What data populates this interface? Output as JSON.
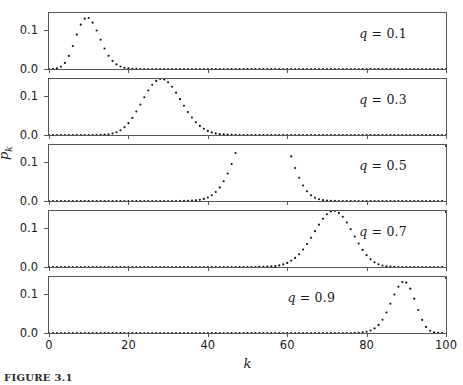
{
  "figure": {
    "caption": "FIGURE 3.1",
    "axes": {
      "xlabel": "k",
      "ylabel_base": "p",
      "ylabel_sub": "k",
      "xticks": [
        0,
        20,
        40,
        60,
        80,
        100
      ],
      "xtick_labels": [
        "0",
        "20",
        "40",
        "60",
        "80",
        "100"
      ],
      "yticks": [
        0.0,
        0.1
      ],
      "ytick_labels": [
        "0.0",
        "0.1"
      ],
      "xlim": [
        0,
        100
      ],
      "ylim": [
        0.0,
        0.145
      ]
    },
    "style": {
      "marker_color": "#111111",
      "axis_color": "#555555",
      "background": "#ffffff",
      "marker_size": 2.1
    }
  },
  "chart_data": {
    "type": "scatter",
    "title": "",
    "xlabel": "k",
    "ylabel": "p̄_k",
    "xlim": [
      0,
      100
    ],
    "ylim": [
      0.0,
      0.145
    ],
    "grid": false,
    "legend": "none",
    "n": 100,
    "panel_annotation_prefix": "q = ",
    "panels": [
      {
        "label": "q = 0.1",
        "q": 0.1,
        "peak_k": 10,
        "peak_value": 0.132,
        "label_pos_frac": 0.78,
        "x": [
          0,
          1,
          2,
          3,
          4,
          5,
          6,
          7,
          8,
          9,
          10,
          11,
          12,
          13,
          14,
          15,
          16,
          17,
          18,
          19,
          20,
          21,
          22,
          23,
          24,
          25,
          26,
          27,
          28,
          29,
          30,
          31,
          32,
          33,
          34,
          35,
          36,
          37,
          38,
          39,
          40,
          41,
          42,
          43,
          44,
          45,
          46,
          47,
          48,
          49,
          50,
          51,
          52,
          53,
          54,
          55,
          56,
          57,
          58,
          59,
          60,
          61,
          62,
          63,
          64,
          65,
          66,
          67,
          68,
          69,
          70,
          71,
          72,
          73,
          74,
          75,
          76,
          77,
          78,
          79,
          80,
          81,
          82,
          83,
          84,
          85,
          86,
          87,
          88,
          89,
          90,
          91,
          92,
          93,
          94,
          95,
          96,
          97,
          98,
          99,
          100
        ],
        "y": [
          3e-05,
          0.0003,
          0.00162,
          0.00589,
          0.01587,
          0.03387,
          0.05957,
          0.08889,
          0.11484,
          0.13041,
          0.13187,
          0.12017,
          0.09963,
          0.07567,
          0.05304,
          0.03449,
          0.02093,
          0.01189,
          0.00634,
          0.00319,
          0.00151,
          0.00068,
          0.00029,
          0.00012,
          5e-05,
          2e-05,
          1e-05,
          0.0,
          0.0,
          0.0,
          0.0,
          0.0,
          0.0,
          0.0,
          0.0,
          0.0,
          0.0,
          0.0,
          0.0,
          0.0,
          0.0,
          0.0,
          0.0,
          0.0,
          0.0,
          0.0,
          0.0,
          0.0,
          0.0,
          0.0,
          0.0,
          0.0,
          0.0,
          0.0,
          0.0,
          0.0,
          0.0,
          0.0,
          0.0,
          0.0,
          0.0,
          0.0,
          0.0,
          0.0,
          0.0,
          0.0,
          0.0,
          0.0,
          0.0,
          0.0,
          0.0,
          0.0,
          0.0,
          0.0,
          0.0,
          0.0,
          0.0,
          0.0,
          0.0,
          0.0,
          0.0,
          0.0,
          0.0,
          0.0,
          0.0,
          0.0,
          0.0,
          0.0,
          0.0,
          0.0,
          0.0,
          0.0,
          0.0,
          0.0,
          0.0,
          0.0,
          0.0,
          0.0,
          0.0,
          0.0,
          0.0,
          0.0,
          0.0
        ]
      },
      {
        "label": "q = 0.3",
        "q": 0.3,
        "peak_k": 30,
        "peak_value": 0.0868,
        "label_pos_frac": 0.78,
        "x": [
          0,
          1,
          2,
          3,
          4,
          5,
          6,
          7,
          8,
          9,
          10,
          11,
          12,
          13,
          14,
          15,
          16,
          17,
          18,
          19,
          20,
          21,
          22,
          23,
          24,
          25,
          26,
          27,
          28,
          29,
          30,
          31,
          32,
          33,
          34,
          35,
          36,
          37,
          38,
          39,
          40,
          41,
          42,
          43,
          44,
          45,
          46,
          47,
          48,
          49,
          50,
          51,
          52,
          53,
          54,
          55,
          56,
          57,
          58,
          59,
          60,
          61,
          62,
          63,
          64,
          65,
          66,
          67,
          68,
          69,
          70,
          71,
          72,
          73,
          74,
          75,
          76,
          77,
          78,
          79,
          80,
          81,
          82,
          83,
          84,
          85,
          86,
          87,
          88,
          89,
          90,
          91,
          92,
          93,
          94,
          95,
          96,
          97,
          98,
          99,
          100
        ],
        "y": [
          0.0,
          0.0,
          0.0,
          0.0,
          0.0,
          0.0,
          0.0,
          0.0,
          0.0,
          0.0,
          2e-05,
          6e-05,
          0.00016,
          0.00039,
          0.0009,
          0.00193,
          0.00383,
          0.00709,
          0.01229,
          0.02,
          0.03065,
          0.04437,
          0.0608,
          0.07906,
          0.09782,
          0.11541,
          0.13006,
          0.14026,
          0.14494,
          0.14365,
          0.13662,
          0.12482,
          0.10967,
          0.09277,
          0.07564,
          0.05949,
          0.04517,
          0.03316,
          0.02354,
          0.01616,
          0.01074,
          0.00691,
          0.00431,
          0.0026,
          0.00152,
          0.00086,
          0.00047,
          0.00025,
          0.00013,
          7e-05,
          3e-05,
          1e-05,
          1e-05,
          0.0,
          0.0,
          0.0,
          0.0,
          0.0,
          0.0,
          0.0,
          0.0,
          0.0,
          0.0,
          0.0,
          0.0,
          0.0,
          0.0,
          0.0,
          0.0,
          0.0,
          0.0,
          0.0,
          0.0,
          0.0,
          0.0,
          0.0,
          0.0,
          0.0,
          0.0,
          0.0,
          0.0,
          0.0,
          0.0,
          0.0,
          0.0,
          0.0,
          0.0,
          0.0,
          0.0,
          0.0,
          0.0,
          0.0,
          0.0,
          0.0,
          0.0,
          0.0,
          0.0,
          0.0,
          0.0,
          0.0,
          0.0
        ]
      },
      {
        "label": "q = 0.5",
        "q": 0.5,
        "peak_k": 50,
        "peak_value": 0.0796,
        "label_pos_frac": 0.78,
        "x": [
          0,
          1,
          2,
          3,
          4,
          5,
          6,
          7,
          8,
          9,
          10,
          11,
          12,
          13,
          14,
          15,
          16,
          17,
          18,
          19,
          20,
          21,
          22,
          23,
          24,
          25,
          26,
          27,
          28,
          29,
          30,
          31,
          32,
          33,
          34,
          35,
          36,
          37,
          38,
          39,
          40,
          41,
          42,
          43,
          44,
          45,
          46,
          47,
          48,
          49,
          50,
          51,
          52,
          53,
          54,
          55,
          56,
          57,
          58,
          59,
          60,
          61,
          62,
          63,
          64,
          65,
          66,
          67,
          68,
          69,
          70,
          71,
          72,
          73,
          74,
          75,
          76,
          77,
          78,
          79,
          80,
          81,
          82,
          83,
          84,
          85,
          86,
          87,
          88,
          89,
          90,
          91,
          92,
          93,
          94,
          95,
          96,
          97,
          98,
          99,
          100
        ],
        "y": [
          0.0,
          0.0,
          0.0,
          0.0,
          0.0,
          0.0,
          0.0,
          0.0,
          0.0,
          0.0,
          0.0,
          0.0,
          0.0,
          0.0,
          0.0,
          0.0,
          0.0,
          0.0,
          0.0,
          0.0,
          0.0,
          0.0,
          0.0,
          0.0,
          0.0,
          0.0,
          0.0,
          0.0,
          0.0,
          0.0,
          1e-05,
          2e-05,
          4e-05,
          9e-05,
          0.0002,
          0.00043,
          0.00087,
          0.00168,
          0.00309,
          0.00545,
          0.00922,
          0.01499,
          0.02343,
          0.03525,
          0.05108,
          0.07129,
          0.09591,
          0.12441,
          0.15569,
          0.18797,
          0.21905,
          0.24621,
          0.26711,
          0.27995,
          0.28368,
          0.27806,
          0.26367,
          0.24175,
          0.21401,
          0.18248,
          0.14877,
          0.11565,
          0.08556,
          0.06016,
          0.04004,
          0.02521,
          0.01495,
          0.00835,
          0.00442,
          0.00221,
          0.00104,
          0.00047,
          0.0002,
          8e-05,
          3e-05,
          1e-05,
          0.0,
          0.0,
          0.0,
          0.0,
          0.0,
          0.0,
          0.0,
          0.0,
          0.0,
          0.0,
          0.0,
          0.0,
          0.0,
          0.0,
          0.0,
          0.0,
          0.0,
          0.0,
          0.0,
          0.0,
          0.0,
          0.0,
          0.0,
          0.0
        ]
      },
      {
        "label": "q = 0.7",
        "q": 0.7,
        "peak_k": 70,
        "peak_value": 0.0868,
        "label_pos_frac": 0.78,
        "x": [
          0,
          1,
          2,
          3,
          4,
          5,
          6,
          7,
          8,
          9,
          10,
          11,
          12,
          13,
          14,
          15,
          16,
          17,
          18,
          19,
          20,
          21,
          22,
          23,
          24,
          25,
          26,
          27,
          28,
          29,
          30,
          31,
          32,
          33,
          34,
          35,
          36,
          37,
          38,
          39,
          40,
          41,
          42,
          43,
          44,
          45,
          46,
          47,
          48,
          49,
          50,
          51,
          52,
          53,
          54,
          55,
          56,
          57,
          58,
          59,
          60,
          61,
          62,
          63,
          64,
          65,
          66,
          67,
          68,
          69,
          70,
          71,
          72,
          73,
          74,
          75,
          76,
          77,
          78,
          79,
          80,
          81,
          82,
          83,
          84,
          85,
          86,
          87,
          88,
          89,
          90,
          91,
          92,
          93,
          94,
          95,
          96,
          97,
          98,
          99,
          100
        ],
        "y": [
          0.0,
          0.0,
          0.0,
          0.0,
          0.0,
          0.0,
          0.0,
          0.0,
          0.0,
          0.0,
          0.0,
          0.0,
          0.0,
          0.0,
          0.0,
          0.0,
          0.0,
          0.0,
          0.0,
          0.0,
          0.0,
          0.0,
          0.0,
          0.0,
          0.0,
          0.0,
          0.0,
          0.0,
          0.0,
          0.0,
          0.0,
          0.0,
          0.0,
          0.0,
          0.0,
          0.0,
          0.0,
          0.0,
          0.0,
          0.0,
          0.0,
          0.0,
          0.0,
          0.0,
          0.0,
          0.0,
          0.0,
          0.0,
          0.0,
          1e-05,
          3e-05,
          7e-05,
          0.00013,
          0.00025,
          0.00047,
          0.00086,
          0.00152,
          0.0026,
          0.00431,
          0.00691,
          0.01074,
          0.01616,
          0.02354,
          0.03316,
          0.04517,
          0.05949,
          0.07564,
          0.09277,
          0.10967,
          0.12482,
          0.13662,
          0.14365,
          0.14494,
          0.14026,
          0.13006,
          0.11541,
          0.09782,
          0.07906,
          0.0608,
          0.04437,
          0.03065,
          0.02,
          0.01229,
          0.00709,
          0.00383,
          0.00193,
          0.0009,
          0.00039,
          0.00016,
          6e-05,
          2e-05,
          1e-05,
          0.0,
          0.0,
          0.0,
          0.0,
          0.0,
          0.0,
          0.0,
          0.0
        ]
      },
      {
        "label": "q = 0.9",
        "q": 0.9,
        "peak_k": 90,
        "peak_value": 0.132,
        "label_pos_frac": 0.6,
        "x": [
          0,
          1,
          2,
          3,
          4,
          5,
          6,
          7,
          8,
          9,
          10,
          11,
          12,
          13,
          14,
          15,
          16,
          17,
          18,
          19,
          20,
          21,
          22,
          23,
          24,
          25,
          26,
          27,
          28,
          29,
          30,
          31,
          32,
          33,
          34,
          35,
          36,
          37,
          38,
          39,
          40,
          41,
          42,
          43,
          44,
          45,
          46,
          47,
          48,
          49,
          50,
          51,
          52,
          53,
          54,
          55,
          56,
          57,
          58,
          59,
          60,
          61,
          62,
          63,
          64,
          65,
          66,
          67,
          68,
          69,
          70,
          71,
          72,
          73,
          74,
          75,
          76,
          77,
          78,
          79,
          80,
          81,
          82,
          83,
          84,
          85,
          86,
          87,
          88,
          89,
          90,
          91,
          92,
          93,
          94,
          95,
          96,
          97,
          98,
          99,
          100
        ],
        "y": [
          0.0,
          0.0,
          0.0,
          0.0,
          0.0,
          0.0,
          0.0,
          0.0,
          0.0,
          0.0,
          0.0,
          0.0,
          0.0,
          0.0,
          0.0,
          0.0,
          0.0,
          0.0,
          0.0,
          0.0,
          0.0,
          0.0,
          0.0,
          0.0,
          0.0,
          0.0,
          0.0,
          0.0,
          0.0,
          0.0,
          0.0,
          0.0,
          0.0,
          0.0,
          0.0,
          0.0,
          0.0,
          0.0,
          0.0,
          0.0,
          0.0,
          0.0,
          0.0,
          0.0,
          0.0,
          0.0,
          0.0,
          0.0,
          0.0,
          0.0,
          0.0,
          0.0,
          0.0,
          0.0,
          0.0,
          0.0,
          0.0,
          0.0,
          0.0,
          0.0,
          0.0,
          0.0,
          0.0,
          0.0,
          0.0,
          0.0,
          0.0,
          0.0,
          0.0,
          0.0,
          0.0,
          0.0,
          0.0,
          1e-05,
          2e-05,
          5e-05,
          0.00012,
          0.00029,
          0.00068,
          0.00151,
          0.00319,
          0.00634,
          0.01189,
          0.02093,
          0.03449,
          0.05304,
          0.07567,
          0.09963,
          0.12017,
          0.13187,
          0.13041,
          0.11484,
          0.08889,
          0.05957,
          0.03387,
          0.01587,
          0.00589,
          0.00162,
          0.0003,
          3e-05
        ]
      }
    ]
  }
}
